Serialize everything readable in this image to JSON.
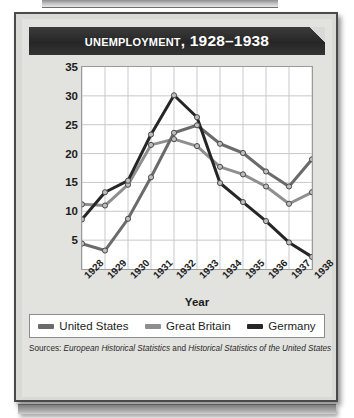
{
  "title": "Unemployment, 1928–1938",
  "sources": {
    "prefix": "Sources:",
    "work1": "European Historical Statistics",
    "conjunction": "and",
    "work2": "Historical Statistics of the United States"
  },
  "legend": [
    {
      "label": "United States",
      "color": "#6b6b6b"
    },
    {
      "label": "Great Britain",
      "color": "#8f8f8f"
    },
    {
      "label": "Germany",
      "color": "#262626"
    }
  ],
  "colors": {
    "united_states": "#6b6b6b",
    "great_britain": "#8f8f8f",
    "germany": "#262626",
    "grid": "#c9c9c9",
    "plot_background": "#ffffff",
    "plate": "#d9d9d6",
    "title_bar": "#2b2b2b",
    "marker_fill": "#bdbdbd",
    "marker_stroke": "#4a4a4a"
  },
  "chart_data": {
    "type": "line",
    "title": "Unemployment, 1928–1938",
    "xlabel": "Year",
    "ylabel": "Percentage of Work Force",
    "categories": [
      "1928",
      "1929",
      "1930",
      "1931",
      "1932",
      "1933",
      "1934",
      "1935",
      "1936",
      "1937",
      "1938"
    ],
    "ylim": [
      0,
      35
    ],
    "yticks": [
      5,
      10,
      15,
      20,
      25,
      30,
      35
    ],
    "grid": true,
    "legend_position": "bottom",
    "markers": true,
    "series": [
      {
        "name": "United States",
        "color": "#6b6b6b",
        "values": [
          4.4,
          3.2,
          8.7,
          15.9,
          23.6,
          24.9,
          21.7,
          20.1,
          16.9,
          14.3,
          19.0
        ]
      },
      {
        "name": "Great Britain",
        "color": "#8f8f8f",
        "values": [
          11.2,
          11.0,
          14.6,
          21.5,
          22.5,
          21.3,
          17.7,
          16.4,
          14.3,
          11.3,
          13.3
        ]
      },
      {
        "name": "Germany",
        "color": "#262626",
        "values": [
          8.6,
          13.3,
          15.3,
          23.3,
          30.1,
          26.3,
          14.9,
          11.6,
          8.3,
          4.6,
          2.1
        ]
      }
    ]
  }
}
